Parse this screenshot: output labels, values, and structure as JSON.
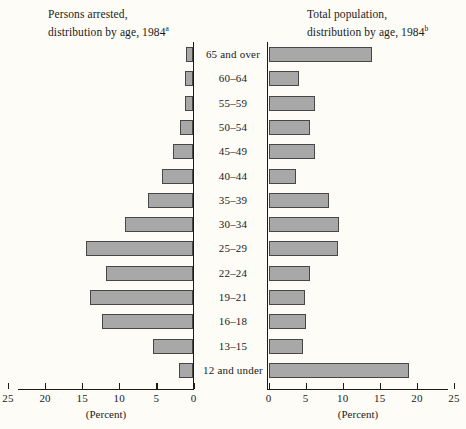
{
  "left_panel": {
    "title_line1": "Persons arrested,",
    "title_line2": "distribution by age, 1984",
    "title_footnote": "a",
    "axis_caption": "(Percent)",
    "axis_ticks": [
      "25",
      "20",
      "15",
      "10",
      "5",
      "0"
    ]
  },
  "right_panel": {
    "title_line1": "Total population,",
    "title_line2": "distribution by age, 1984",
    "title_footnote": "b",
    "axis_caption": "(Percent)",
    "axis_ticks": [
      "0",
      "5",
      "10",
      "15",
      "20",
      "25"
    ]
  },
  "colors": {
    "bar_fill": "#a8a8a8",
    "bar_stroke": "#474747",
    "axis": "#1a1a1a",
    "background": "#fdfcf7"
  },
  "chart_data": {
    "type": "bar",
    "orientation": "horizontal",
    "layout": "back-to-back population pyramid",
    "xlabel": "(Percent)",
    "ylabel": "",
    "grid": false,
    "legend": "none",
    "xlim_left": [
      25,
      0
    ],
    "xlim_right": [
      0,
      25
    ],
    "categories": [
      "65 and over",
      "60-64",
      "55-59",
      "50-54",
      "45-49",
      "40-44",
      "35-39",
      "30-34",
      "25-29",
      "22-24",
      "19-21",
      "16-18",
      "13-15",
      "12 and under"
    ],
    "series": [
      {
        "name": "Persons arrested, distribution by age, 1984",
        "side": "left",
        "values": [
          1.0,
          1.1,
          1.2,
          1.8,
          2.7,
          4.2,
          6.1,
          9.2,
          14.5,
          11.8,
          14.0,
          12.3,
          5.5,
          2.0
        ]
      },
      {
        "name": "Total population, distribution by age, 1984",
        "side": "right",
        "values": [
          13.9,
          4.1,
          6.3,
          5.6,
          6.2,
          3.7,
          8.2,
          9.5,
          9.3,
          5.6,
          4.9,
          5.0,
          4.7,
          19.0
        ]
      }
    ]
  }
}
